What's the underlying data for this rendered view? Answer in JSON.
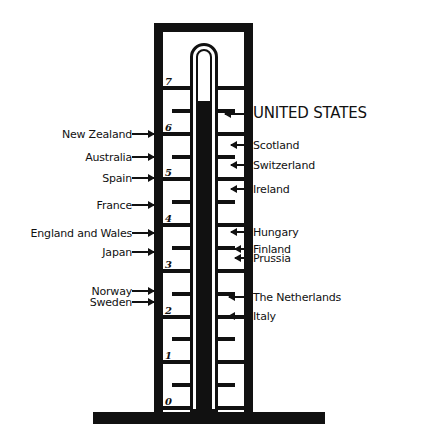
{
  "chart_data": {
    "type": "bar",
    "title": "",
    "subtitle": "",
    "xlabel": "",
    "ylabel": "",
    "ylim": [
      0,
      7
    ],
    "grid": true,
    "legend_position": "none",
    "axis": {
      "tick_labels": [
        "7",
        "6",
        "5",
        "4",
        "3",
        "2",
        "1",
        "0"
      ],
      "tick_values": [
        7,
        6,
        5,
        4,
        3,
        2,
        1,
        0
      ],
      "minor_ticks_at": [
        6.5,
        5.5,
        4.5,
        3.5,
        2.5,
        1.5,
        0.5
      ]
    },
    "reading": {
      "label": "UNITED STATES",
      "value": 6.7
    },
    "categories": [
      "UNITED STATES",
      "New Zealand",
      "Scotland",
      "Australia",
      "Switzerland",
      "Spain",
      "Ireland",
      "France",
      "England and Wales",
      "Hungary",
      "Japan",
      "Finland",
      "Prussia",
      "Norway",
      "The Netherlands",
      "Sweden",
      "Italy"
    ],
    "values": [
      6.7,
      6.05,
      5.95,
      5.6,
      5.55,
      5.2,
      5.1,
      4.6,
      4.05,
      4.0,
      3.6,
      3.55,
      3.45,
      2.8,
      2.7,
      2.65,
      2.35
    ],
    "series": [
      {
        "name": "scale reading",
        "values": [
          6.7,
          6.05,
          5.95,
          5.6,
          5.55,
          5.2,
          5.1,
          4.6,
          4.05,
          4.0,
          3.6,
          3.55,
          3.45,
          2.8,
          2.7,
          2.65,
          2.35
        ]
      }
    ]
  },
  "left_labels": [
    {
      "name": "new-zealand",
      "text": "New Zealand",
      "value": 6.05,
      "top": 128,
      "right": 154,
      "arrow_width": 22,
      "font_size": 11
    },
    {
      "name": "australia",
      "text": "Australia",
      "value": 5.6,
      "top": 151,
      "right": 154,
      "arrow_width": 22,
      "font_size": 11
    },
    {
      "name": "spain",
      "text": "Spain",
      "value": 5.2,
      "top": 172,
      "right": 154,
      "arrow_width": 22,
      "font_size": 11
    },
    {
      "name": "france",
      "text": "France",
      "value": 4.6,
      "top": 199,
      "right": 154,
      "arrow_width": 22,
      "font_size": 11
    },
    {
      "name": "england-and-wales",
      "text": "England and Wales",
      "value": 4.05,
      "top": 227,
      "right": 154,
      "arrow_width": 22,
      "font_size": 11
    },
    {
      "name": "japan",
      "text": "Japan",
      "value": 3.6,
      "top": 246,
      "right": 154,
      "arrow_width": 22,
      "font_size": 11
    },
    {
      "name": "norway",
      "text": "Norway",
      "value": 2.8,
      "top": 285,
      "right": 154,
      "arrow_width": 22,
      "font_size": 11
    },
    {
      "name": "sweden",
      "text": "Sweden",
      "value": 2.65,
      "top": 296,
      "right": 154,
      "arrow_width": 22,
      "font_size": 11
    }
  ],
  "right_labels": [
    {
      "name": "united-states",
      "text": "UNITED STATES",
      "value": 6.7,
      "top": 106,
      "left": 258,
      "arrow_width": 28,
      "font_size": 15
    },
    {
      "name": "scotland",
      "text": "Scotland",
      "value": 5.95,
      "top": 139,
      "left": 258,
      "arrow_width": 22,
      "font_size": 11
    },
    {
      "name": "switzerland",
      "text": "Switzerland",
      "value": 5.55,
      "top": 159,
      "left": 258,
      "arrow_width": 22,
      "font_size": 11
    },
    {
      "name": "ireland",
      "text": "Ireland",
      "value": 5.1,
      "top": 183,
      "left": 258,
      "arrow_width": 22,
      "font_size": 11
    },
    {
      "name": "hungary",
      "text": "Hungary",
      "value": 4.0,
      "top": 226,
      "left": 258,
      "arrow_width": 22,
      "font_size": 11
    },
    {
      "name": "finland",
      "text": "Finland",
      "value": 3.55,
      "top": 243,
      "left": 258,
      "arrow_width": 18,
      "font_size": 11
    },
    {
      "name": "prussia",
      "text": "Prussia",
      "value": 3.45,
      "top": 252,
      "left": 258,
      "arrow_width": 18,
      "font_size": 11
    },
    {
      "name": "the-netherlands",
      "text": "The Netherlands",
      "value": 2.7,
      "top": 291,
      "left": 258,
      "arrow_width": 24,
      "font_size": 11
    },
    {
      "name": "italy",
      "text": "Italy",
      "value": 2.35,
      "top": 310,
      "left": 258,
      "arrow_width": 24,
      "font_size": 11
    }
  ],
  "geometry": {
    "frame": {
      "left": 154,
      "right": 253,
      "top": 23,
      "bottom": 412,
      "thickness": 9
    },
    "baseplate": {
      "left": 93,
      "top": 412,
      "width": 232,
      "height": 12
    },
    "tube": {
      "left": 190,
      "top": 43,
      "width": 28,
      "bottom": 412
    },
    "scale": {
      "y_top": 88,
      "y_bottom": 408
    },
    "mercury_top_y": 103,
    "colors": {
      "ink": "#111111",
      "paper": "#ffffff"
    }
  }
}
